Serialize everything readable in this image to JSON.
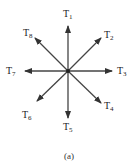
{
  "diagram": {
    "center": {
      "x": 68,
      "y": 71
    },
    "line_color": "#444444",
    "vectors": [
      {
        "name": "T",
        "sub": "1",
        "tip": [
          68,
          26
        ],
        "label_pos": [
          63,
          9
        ]
      },
      {
        "name": "T",
        "sub": "2",
        "tip": [
          101,
          38
        ],
        "label_pos": [
          104,
          30
        ]
      },
      {
        "name": "T",
        "sub": "3",
        "tip": [
          112,
          71
        ],
        "label_pos": [
          117,
          66
        ]
      },
      {
        "name": "T",
        "sub": "4",
        "tip": [
          101,
          103
        ],
        "label_pos": [
          104,
          101
        ]
      },
      {
        "name": "T",
        "sub": "5",
        "tip": [
          68,
          118
        ],
        "label_pos": [
          63,
          122
        ]
      },
      {
        "name": "T",
        "sub": "6",
        "tip": [
          37,
          101
        ],
        "label_pos": [
          22,
          110
        ]
      },
      {
        "name": "T",
        "sub": "7",
        "tip": [
          25,
          71
        ],
        "label_pos": [
          6,
          66
        ]
      },
      {
        "name": "T",
        "sub": "8",
        "tip": [
          35,
          38
        ],
        "label_pos": [
          23,
          28
        ]
      }
    ],
    "caption": "(a)"
  }
}
